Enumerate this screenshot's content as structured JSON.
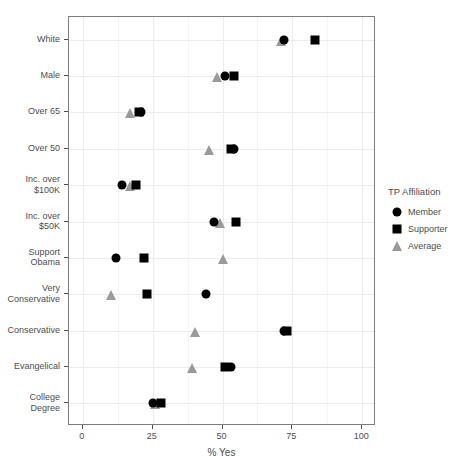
{
  "chart_data": {
    "type": "scatter",
    "title": "",
    "xlabel": "% Yes",
    "ylabel": "",
    "xlim": [
      0,
      100
    ],
    "xticks": [
      0,
      25,
      50,
      75,
      100
    ],
    "xtick_labels": [
      "0",
      "25",
      "50",
      "75",
      "100"
    ],
    "grid": true,
    "legend_position": "right",
    "legend_title": "TP Affiliation",
    "categories": [
      "White",
      "Male",
      "Over 65",
      "Over 50",
      "Inc. over\n$100K",
      "Inc. over\n$50K",
      "Support\nObama",
      "Very\nConservative",
      "Conservative",
      "Evangelical",
      "College Degree"
    ],
    "series": [
      {
        "name": "Member",
        "marker": "circle",
        "color": "#000000",
        "values": [
          72,
          51,
          21,
          54,
          14,
          47,
          12,
          44,
          72,
          53,
          25
        ]
      },
      {
        "name": "Supporter",
        "marker": "square",
        "color": "#000000",
        "values": [
          83,
          54,
          20,
          53,
          19,
          55,
          22,
          23,
          73,
          51,
          28
        ]
      },
      {
        "name": "Average",
        "marker": "triangle",
        "color": "#9a9a9a",
        "values": [
          71,
          48,
          17,
          45,
          17,
          49,
          50,
          10,
          40,
          39,
          26
        ]
      }
    ]
  }
}
